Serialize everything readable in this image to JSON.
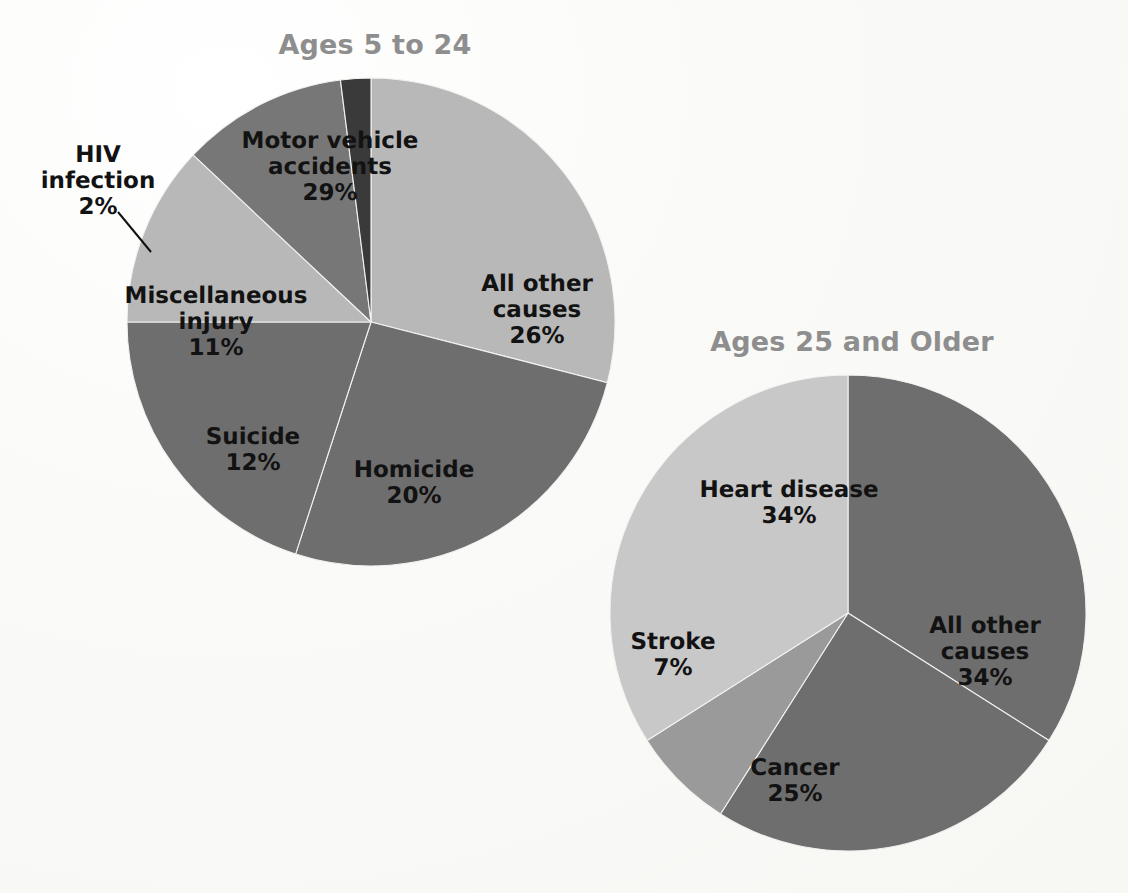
{
  "figure": {
    "background_color": "#fbfbf9",
    "title_color": "#8e8e8e",
    "label_color": "#121212"
  },
  "charts": [
    {
      "id": "ages-5-to-24",
      "title": "Ages 5 to 24",
      "title_x": 375,
      "title_y": 44,
      "center_x": 371,
      "center_y": 322,
      "radius": 244,
      "slices": [
        {
          "name": "Motor vehicle accidents",
          "percent_label": "29%",
          "value": 29,
          "color": "#b8b8b8",
          "label_x": 330,
          "label_y": 167,
          "lines": [
            "Motor vehicle",
            "accidents"
          ]
        },
        {
          "name": "All other causes",
          "percent_label": "26%",
          "value": 26,
          "color": "#6e6e6e",
          "label_x": 537,
          "label_y": 310,
          "lines": [
            "All other",
            "causes"
          ]
        },
        {
          "name": "Homicide",
          "percent_label": "20%",
          "value": 20,
          "color": "#6e6e6e",
          "label_x": 414,
          "label_y": 483,
          "lines": [
            "Homicide"
          ]
        },
        {
          "name": "Suicide",
          "percent_label": "12%",
          "value": 12,
          "color": "#b8b8b8",
          "label_x": 253,
          "label_y": 450,
          "lines": [
            "Suicide"
          ]
        },
        {
          "name": "Miscellaneous injury",
          "percent_label": "11%",
          "value": 11,
          "color": "#777777",
          "label_x": 216,
          "label_y": 322,
          "lines": [
            "Miscellaneous",
            "injury"
          ]
        },
        {
          "name": "HIV infection",
          "percent_label": "2%",
          "value": 2,
          "color": "#3a3a3a",
          "label_x": 98,
          "label_y": 181,
          "lines": [
            "HIV",
            "infection"
          ],
          "leader_line": {
            "x1": 118,
            "y1": 212,
            "x2": 151,
            "y2": 252
          }
        }
      ]
    },
    {
      "id": "ages-25-and-older",
      "title": "Ages 25 and Older",
      "title_x": 852,
      "title_y": 341,
      "center_x": 848,
      "center_y": 613,
      "radius": 238,
      "slices": [
        {
          "name": "All other causes",
          "percent_label": "34%",
          "value": 34,
          "color": "#6e6e6e",
          "label_x": 985,
          "label_y": 652,
          "lines": [
            "All other",
            "causes"
          ]
        },
        {
          "name": "Cancer",
          "percent_label": "25%",
          "value": 25,
          "color": "#6e6e6e",
          "label_x": 795,
          "label_y": 781,
          "lines": [
            "Cancer"
          ]
        },
        {
          "name": "Stroke",
          "percent_label": "7%",
          "value": 7,
          "color": "#9a9a9a",
          "label_x": 673,
          "label_y": 655,
          "lines": [
            "Stroke"
          ]
        },
        {
          "name": "Heart disease",
          "percent_label": "34%",
          "value": 34,
          "color": "#c8c8c8",
          "label_x": 789,
          "label_y": 503,
          "lines": [
            "Heart disease"
          ]
        }
      ]
    }
  ],
  "chart_data": [
    {
      "type": "pie",
      "title": "Ages 5 to 24",
      "categories": [
        "Motor vehicle accidents",
        "All other causes",
        "Homicide",
        "Suicide",
        "Miscellaneous injury",
        "HIV infection"
      ],
      "values": [
        29,
        26,
        20,
        12,
        11,
        2
      ],
      "value_labels": [
        "29%",
        "26%",
        "20%",
        "12%",
        "11%",
        "2%"
      ],
      "units": "percent",
      "start_angle_deg": 0,
      "direction": "clockwise",
      "colors": [
        "#b8b8b8",
        "#6e6e6e",
        "#6e6e6e",
        "#b8b8b8",
        "#777777",
        "#3a3a3a"
      ],
      "legend": "none",
      "labels_inside": true,
      "xlabel": "",
      "ylabel": ""
    },
    {
      "type": "pie",
      "title": "Ages 25 and Older",
      "categories": [
        "All other causes",
        "Cancer",
        "Stroke",
        "Heart disease"
      ],
      "values": [
        34,
        25,
        7,
        34
      ],
      "value_labels": [
        "34%",
        "25%",
        "7%",
        "34%"
      ],
      "units": "percent",
      "start_angle_deg": 0,
      "direction": "clockwise",
      "colors": [
        "#6e6e6e",
        "#6e6e6e",
        "#9a9a9a",
        "#c8c8c8"
      ],
      "legend": "none",
      "labels_inside": true,
      "xlabel": "",
      "ylabel": ""
    }
  ]
}
